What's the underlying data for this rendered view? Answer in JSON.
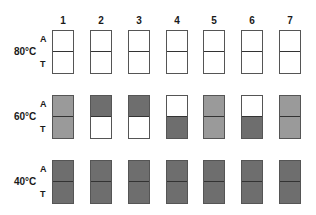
{
  "columns": [
    "1",
    "2",
    "3",
    "4",
    "5",
    "6",
    "7"
  ],
  "strand_labels": {
    "top": "A",
    "bottom": "T"
  },
  "colors": {
    "empty": "#ffffff",
    "light": "#9a9a9a",
    "dark": "#6e6e6e"
  },
  "rows": [
    {
      "temp": "80°C",
      "cells": [
        [
          "empty",
          "empty"
        ],
        [
          "empty",
          "empty"
        ],
        [
          "empty",
          "empty"
        ],
        [
          "empty",
          "empty"
        ],
        [
          "empty",
          "empty"
        ],
        [
          "empty",
          "empty"
        ],
        [
          "empty",
          "empty"
        ]
      ]
    },
    {
      "temp": "60°C",
      "cells": [
        [
          "light",
          "light"
        ],
        [
          "dark",
          "empty"
        ],
        [
          "dark",
          "empty"
        ],
        [
          "empty",
          "dark"
        ],
        [
          "light",
          "light"
        ],
        [
          "empty",
          "dark"
        ],
        [
          "light",
          "light"
        ]
      ]
    },
    {
      "temp": "40°C",
      "cells": [
        [
          "dark",
          "dark"
        ],
        [
          "dark",
          "dark"
        ],
        [
          "dark",
          "dark"
        ],
        [
          "dark",
          "dark"
        ],
        [
          "dark",
          "dark"
        ],
        [
          "dark",
          "dark"
        ],
        [
          "dark",
          "dark"
        ]
      ]
    }
  ]
}
